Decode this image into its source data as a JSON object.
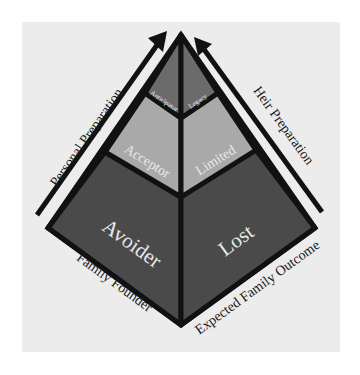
{
  "diagram": {
    "type": "pyramid",
    "colors": {
      "background": "#ececec",
      "top_tier": "#6b6b6b",
      "middle_tier": "#a9a9a9",
      "bottom_tier": "#4a4a4a",
      "outline": "#111111",
      "segment_text": "#e8e8e8",
      "axis_text": "#1a1a1a"
    },
    "tiers": {
      "top": {
        "left_label": "Anticipator",
        "right_label": "Legacy"
      },
      "middle": {
        "left_label": "Acceptor",
        "right_label": "Limited"
      },
      "bottom": {
        "left_label": "Avoider",
        "right_label": "Lost"
      }
    },
    "arrows": {
      "left": {
        "label": "Personal Preparation"
      },
      "right": {
        "label": "Heir Preparation"
      }
    },
    "axes": {
      "left_bottom": {
        "label": "Family Founder"
      },
      "right_bottom": {
        "label": "Expected Family Outcome"
      }
    }
  }
}
